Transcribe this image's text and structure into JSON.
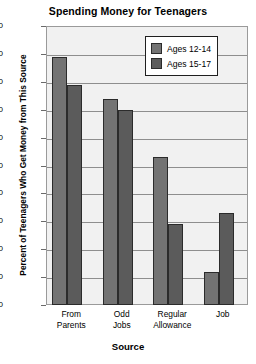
{
  "chart_data": {
    "type": "bar",
    "title": "Spending Money for Teenagers",
    "xlabel": "Source",
    "ylabel": "Percent of Teenagers Who Get Money from This Source",
    "categories": [
      "From Parents",
      "Odd Jobs",
      "Regular Allowance",
      "Job"
    ],
    "category_lines": [
      [
        "From",
        "Parents"
      ],
      [
        "Odd",
        "Jobs"
      ],
      [
        "Regular",
        "Allowance"
      ],
      [
        "Job"
      ]
    ],
    "series": [
      {
        "name": "Ages 12-14",
        "color": "#737373",
        "values": [
          89,
          74,
          53,
          12
        ]
      },
      {
        "name": "Ages 15-17",
        "color": "#5b5b5b",
        "values": [
          79,
          70,
          29,
          33
        ]
      }
    ],
    "ylim": [
      0,
      100
    ],
    "yticks": [
      0,
      10,
      20,
      30,
      40,
      50,
      60,
      70,
      80,
      90,
      100
    ],
    "ytick_labels": [
      "0",
      "10",
      "20",
      "30",
      "40",
      "50",
      "60",
      "70",
      "80",
      "90",
      "100"
    ],
    "grid": true,
    "legend_position": "top-right",
    "plot_background": "#f1f1f1",
    "gridline_color": "#8e8e8e",
    "frame_color": "#9a9a9a",
    "bar_outline_color": "#2b2b2b"
  }
}
